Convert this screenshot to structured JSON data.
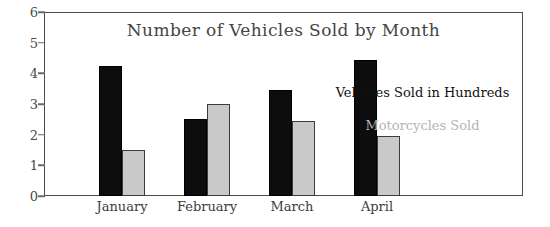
{
  "chart_data": {
    "type": "bar",
    "title": "Number of Vehicles Sold by Month",
    "xlabel": "",
    "ylabel": "",
    "categories": [
      "January",
      "February",
      "March",
      "April"
    ],
    "series": [
      {
        "name": "Vehicles Sold in Hundreds",
        "color": "#0d0d0d",
        "values": [
          4.25,
          2.5,
          3.45,
          4.45
        ]
      },
      {
        "name": "Motorcycles Sold",
        "color": "#c9c9c9",
        "values": [
          1.5,
          3.0,
          2.45,
          1.95
        ]
      }
    ],
    "ylim": [
      0,
      6
    ],
    "yticks": [
      0,
      1,
      2,
      3,
      4,
      5,
      6
    ],
    "ytick_labels": [
      "0",
      "1",
      "2",
      "3",
      "4",
      "5",
      "6"
    ],
    "grid": false,
    "legend_position": "inside-right",
    "legend_style": "text-only"
  },
  "legend": {
    "entries": [
      {
        "label": "Vehicles Sold in Hundreds",
        "color": "#111111"
      },
      {
        "label": "Motorcycles Sold",
        "color": "#b4b4b4"
      }
    ]
  }
}
